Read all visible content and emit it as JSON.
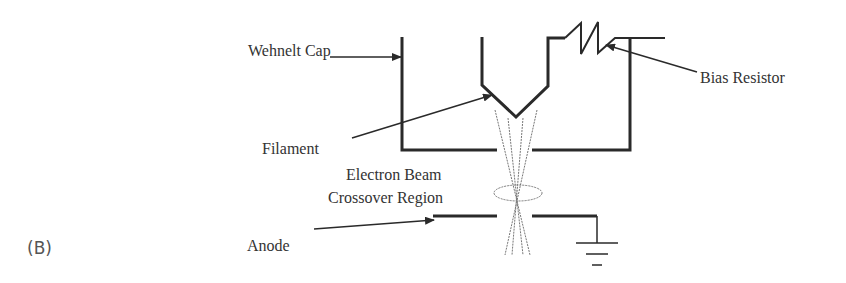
{
  "figure": {
    "panel_label": "(B)",
    "labels": {
      "wehnelt_cap": "Wehnelt Cap",
      "bias_resistor": "Bias Resistor",
      "filament": "Filament",
      "crossover_line1": "Electron Beam",
      "crossover_line2": "Crossover Region",
      "anode": "Anode"
    },
    "colors": {
      "stroke": "#2a2a2a",
      "text": "#333333",
      "beam": "#777777"
    }
  }
}
